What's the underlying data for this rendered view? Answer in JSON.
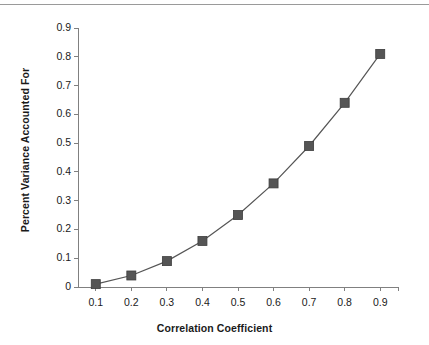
{
  "figure": {
    "background_color": "#ffffff",
    "top_rule_color": "#9a9a9a",
    "axis_color": "#808080",
    "series_color": "#555555",
    "text_color": "#1a1a1a"
  },
  "chart_data": {
    "type": "line",
    "title": "",
    "subtitle": "",
    "xlabel": "Correlation Coefficient",
    "ylabel": "Percent Variance Accounted For",
    "x": [
      0.1,
      0.2,
      0.3,
      0.4,
      0.5,
      0.6,
      0.7,
      0.8,
      0.9
    ],
    "values": [
      0.01,
      0.04,
      0.09,
      0.16,
      0.25,
      0.36,
      0.49,
      0.64,
      0.81
    ],
    "series": [
      {
        "name": "Percent Variance Accounted For",
        "values": [
          0.01,
          0.04,
          0.09,
          0.16,
          0.25,
          0.36,
          0.49,
          0.64,
          0.81
        ]
      }
    ],
    "xlim": [
      0.05,
      0.95
    ],
    "ylim": [
      0,
      0.9
    ],
    "xticks": [
      0.1,
      0.2,
      0.3,
      0.4,
      0.5,
      0.6,
      0.7,
      0.8,
      0.9
    ],
    "yticks": [
      0,
      0.1,
      0.2,
      0.3,
      0.4,
      0.5,
      0.6,
      0.7,
      0.8,
      0.9
    ],
    "xtick_labels": [
      "0.1",
      "0.2",
      "0.3",
      "0.4",
      "0.5",
      "0.6",
      "0.7",
      "0.8",
      "0.9"
    ],
    "ytick_labels": [
      "0",
      "0.1",
      "0.2",
      "0.3",
      "0.4",
      "0.5",
      "0.6",
      "0.7",
      "0.8",
      "0.9"
    ],
    "grid": false,
    "legend": false,
    "legend_position": "none",
    "marker": "square",
    "marker_color": "#555555",
    "line_color": "#555555"
  }
}
